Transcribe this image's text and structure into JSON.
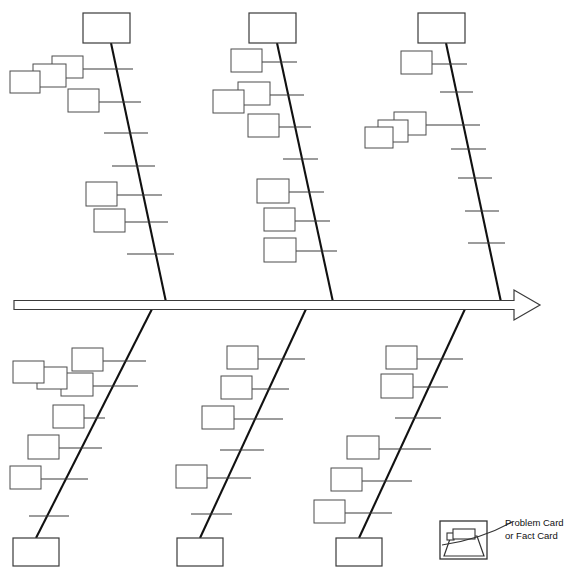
{
  "diagram": {
    "type": "fishbone",
    "canvas": {
      "width": 575,
      "height": 582,
      "background": "#ffffff"
    },
    "colors": {
      "bone_stroke": "#111111",
      "rib_stroke": "#3b3b3b",
      "card_stroke": "#4d4d4d",
      "spine_fill": "#ffffff",
      "text": "#111111"
    },
    "spine": {
      "name": "main-spine-arrow",
      "x1": 14,
      "x2": 540,
      "y": 305,
      "thickness": 9,
      "arrow_length": 26,
      "arrow_half_height": 15,
      "direction": "right"
    },
    "branches": [
      {
        "id": "top-1",
        "side": "top",
        "header_label": "",
        "header_box": {
          "x": 83,
          "y": 13,
          "w": 47,
          "h": 30
        },
        "bone": {
          "x1": 111,
          "y1": 43,
          "x2": 166,
          "y2": 302
        },
        "ribs": [
          {
            "y": 69,
            "x_left": 55,
            "x_right": 133,
            "cards": [
              {
                "x": 52,
                "y": 56,
                "w": 31,
                "h": 22
              },
              {
                "x": 33,
                "y": 64,
                "w": 33,
                "h": 23
              },
              {
                "x": 10,
                "y": 71,
                "w": 30,
                "h": 22
              }
            ]
          },
          {
            "y": 102,
            "x_left": 69,
            "x_right": 141,
            "cards": [
              {
                "x": 68,
                "y": 89,
                "w": 31,
                "h": 23
              }
            ]
          },
          {
            "y": 133,
            "x_left": 104,
            "x_right": 148,
            "cards": []
          },
          {
            "y": 166,
            "x_left": 112,
            "x_right": 155,
            "cards": []
          },
          {
            "y": 195,
            "x_left": 87,
            "x_right": 162,
            "cards": [
              {
                "x": 86,
                "y": 182,
                "w": 31,
                "h": 24
              }
            ]
          },
          {
            "y": 222,
            "x_left": 95,
            "x_right": 168,
            "cards": [
              {
                "x": 94,
                "y": 209,
                "w": 31,
                "h": 23
              }
            ]
          },
          {
            "y": 254,
            "x_left": 127,
            "x_right": 174,
            "cards": []
          }
        ]
      },
      {
        "id": "top-2",
        "side": "top",
        "header_label": "",
        "header_box": {
          "x": 249,
          "y": 13,
          "w": 47,
          "h": 30
        },
        "bone": {
          "x1": 277,
          "y1": 43,
          "x2": 333,
          "y2": 302
        },
        "ribs": [
          {
            "y": 62,
            "x_left": 232,
            "x_right": 297,
            "cards": [
              {
                "x": 231,
                "y": 49,
                "w": 31,
                "h": 23
              }
            ]
          },
          {
            "y": 95,
            "x_left": 239,
            "x_right": 304,
            "cards": [
              {
                "x": 238,
                "y": 82,
                "w": 32,
                "h": 23
              },
              {
                "x": 213,
                "y": 90,
                "w": 31,
                "h": 23
              }
            ]
          },
          {
            "y": 127,
            "x_left": 249,
            "x_right": 311,
            "cards": [
              {
                "x": 248,
                "y": 114,
                "w": 31,
                "h": 23
              }
            ]
          },
          {
            "y": 159,
            "x_left": 283,
            "x_right": 318,
            "cards": []
          },
          {
            "y": 192,
            "x_left": 258,
            "x_right": 324,
            "cards": [
              {
                "x": 257,
                "y": 179,
                "w": 32,
                "h": 24
              }
            ]
          },
          {
            "y": 221,
            "x_left": 265,
            "x_right": 330,
            "cards": [
              {
                "x": 264,
                "y": 208,
                "w": 31,
                "h": 23
              }
            ]
          },
          {
            "y": 251,
            "x_left": 265,
            "x_right": 337,
            "cards": [
              {
                "x": 264,
                "y": 238,
                "w": 32,
                "h": 24
              }
            ]
          }
        ]
      },
      {
        "id": "top-3",
        "side": "top",
        "header_label": "",
        "header_box": {
          "x": 418,
          "y": 13,
          "w": 47,
          "h": 30
        },
        "bone": {
          "x1": 446,
          "y1": 43,
          "x2": 501,
          "y2": 302
        },
        "ribs": [
          {
            "y": 64,
            "x_left": 402,
            "x_right": 467,
            "cards": [
              {
                "x": 401,
                "y": 51,
                "w": 31,
                "h": 23
              }
            ]
          },
          {
            "y": 92,
            "x_left": 440,
            "x_right": 473,
            "cards": []
          },
          {
            "y": 125,
            "x_left": 395,
            "x_right": 480,
            "cards": [
              {
                "x": 394,
                "y": 112,
                "w": 32,
                "h": 23
              },
              {
                "x": 378,
                "y": 120,
                "w": 30,
                "h": 22
              },
              {
                "x": 365,
                "y": 127,
                "w": 28,
                "h": 21
              }
            ]
          },
          {
            "y": 149,
            "x_left": 451,
            "x_right": 486,
            "cards": []
          },
          {
            "y": 178,
            "x_left": 458,
            "x_right": 492,
            "cards": []
          },
          {
            "y": 211,
            "x_left": 465,
            "x_right": 499,
            "cards": []
          },
          {
            "y": 243,
            "x_left": 468,
            "x_right": 505,
            "cards": []
          }
        ]
      },
      {
        "id": "bottom-1",
        "side": "bottom",
        "footer_box": {
          "x": 13,
          "y": 538,
          "w": 46,
          "h": 28
        },
        "bone": {
          "x1": 36,
          "y1": 538,
          "x2": 152,
          "y2": 309
        },
        "ribs": [
          {
            "y": 361,
            "x_left": 73,
            "x_right": 146,
            "cards": [
              {
                "x": 72,
                "y": 348,
                "w": 31,
                "h": 23
              }
            ]
          },
          {
            "y": 386,
            "x_left": 62,
            "x_right": 138,
            "cards": [
              {
                "x": 61,
                "y": 373,
                "w": 32,
                "h": 23
              },
              {
                "x": 37,
                "y": 367,
                "w": 30,
                "h": 22
              },
              {
                "x": 13,
                "y": 361,
                "w": 31,
                "h": 22
              }
            ]
          },
          {
            "y": 418,
            "x_left": 54,
            "x_right": 105,
            "cards": [
              {
                "x": 53,
                "y": 405,
                "w": 31,
                "h": 23
              }
            ]
          },
          {
            "y": 448,
            "x_left": 29,
            "x_right": 102,
            "cards": [
              {
                "x": 28,
                "y": 435,
                "w": 31,
                "h": 24
              }
            ]
          },
          {
            "y": 479,
            "x_left": 11,
            "x_right": 88,
            "cards": [
              {
                "x": 10,
                "y": 466,
                "w": 31,
                "h": 23
              }
            ]
          },
          {
            "y": 516,
            "x_left": 29,
            "x_right": 69,
            "cards": []
          }
        ]
      },
      {
        "id": "bottom-2",
        "side": "bottom",
        "footer_box": {
          "x": 177,
          "y": 538,
          "w": 46,
          "h": 28
        },
        "bone": {
          "x1": 200,
          "y1": 538,
          "x2": 306,
          "y2": 309
        },
        "ribs": [
          {
            "y": 359,
            "x_left": 228,
            "x_right": 305,
            "cards": [
              {
                "x": 227,
                "y": 346,
                "w": 31,
                "h": 23
              }
            ]
          },
          {
            "y": 389,
            "x_left": 222,
            "x_right": 289,
            "cards": [
              {
                "x": 221,
                "y": 376,
                "w": 31,
                "h": 23
              }
            ]
          },
          {
            "y": 419,
            "x_left": 203,
            "x_right": 283,
            "cards": [
              {
                "x": 202,
                "y": 406,
                "w": 32,
                "h": 23
              }
            ]
          },
          {
            "y": 450,
            "x_left": 220,
            "x_right": 264,
            "cards": []
          },
          {
            "y": 478,
            "x_left": 177,
            "x_right": 251,
            "cards": [
              {
                "x": 176,
                "y": 465,
                "w": 31,
                "h": 23
              }
            ]
          },
          {
            "y": 514,
            "x_left": 191,
            "x_right": 232,
            "cards": []
          }
        ]
      },
      {
        "id": "bottom-3",
        "side": "bottom",
        "footer_box": {
          "x": 336,
          "y": 538,
          "w": 46,
          "h": 28
        },
        "bone": {
          "x1": 359,
          "y1": 538,
          "x2": 465,
          "y2": 309
        },
        "ribs": [
          {
            "y": 359,
            "x_left": 387,
            "x_right": 463,
            "cards": [
              {
                "x": 386,
                "y": 346,
                "w": 31,
                "h": 23
              }
            ]
          },
          {
            "y": 387,
            "x_left": 382,
            "x_right": 448,
            "cards": [
              {
                "x": 381,
                "y": 374,
                "w": 32,
                "h": 24
              }
            ]
          },
          {
            "y": 418,
            "x_left": 395,
            "x_right": 441,
            "cards": []
          },
          {
            "y": 449,
            "x_left": 378,
            "x_right": 431,
            "cards": [
              {
                "x": 347,
                "y": 436,
                "w": 32,
                "h": 23
              }
            ]
          },
          {
            "y": 481,
            "x_left": 362,
            "x_right": 412,
            "cards": [
              {
                "x": 331,
                "y": 468,
                "w": 31,
                "h": 23
              }
            ]
          },
          {
            "y": 513,
            "x_left": 345,
            "x_right": 392,
            "cards": [
              {
                "x": 314,
                "y": 500,
                "w": 31,
                "h": 23
              }
            ]
          }
        ]
      }
    ],
    "legend": {
      "name": "problem-card-legend",
      "icon": {
        "frame": {
          "x": 440,
          "y": 521,
          "w": 47,
          "h": 38
        },
        "trapezoid": {
          "top_left_x": 451,
          "top_right_x": 477,
          "top_y": 536,
          "bottom_left_x": 444,
          "bottom_right_x": 484,
          "bottom_y": 556
        },
        "card": {
          "x": 453,
          "y": 529,
          "w": 22,
          "h": 10
        },
        "tab": {
          "x": 447,
          "y": 533,
          "w": 7,
          "h": 7
        }
      },
      "leader_line": {
        "from_x": 487,
        "from_y": 543,
        "to_x": 512,
        "to_y": 522
      },
      "label_line_1": "Problem Card",
      "label_line_2": "or Fact Card"
    }
  }
}
